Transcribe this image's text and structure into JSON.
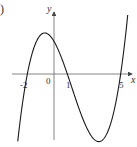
{
  "panel_label": ")",
  "chart_data": {
    "type": "line",
    "title": "",
    "xlabel": "x",
    "ylabel": "y",
    "function": "y = k(x+2)(x-1)(x-5)",
    "roots": [
      -2,
      1,
      5
    ],
    "x_tick_labels": [
      "-2",
      "0",
      "1",
      "5"
    ],
    "x_ticks": [
      -2,
      0,
      1,
      5
    ],
    "xlim": [
      -3,
      6
    ],
    "grid": false,
    "legend": null,
    "series": [
      {
        "name": "curve",
        "x": [
          -2.7,
          -2,
          -1.5,
          -1,
          -0.63,
          0,
          0.5,
          1,
          2,
          3,
          3.3,
          4,
          4.5,
          5,
          5.5
        ],
        "y": [
          -16.6,
          0,
          8.9,
          12,
          12.6,
          10,
          5.6,
          0,
          -12,
          -20,
          -20.7,
          -18,
          -12.8,
          0,
          16.6
        ]
      }
    ],
    "colors": {
      "curve": "#1a1a1a",
      "axes": "#555555"
    }
  }
}
